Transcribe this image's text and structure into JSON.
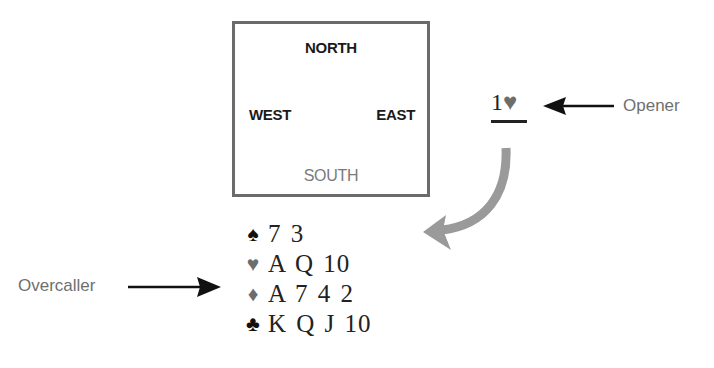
{
  "table": {
    "north": "NORTH",
    "west": "WEST",
    "east": "EAST",
    "south": "SOUTH"
  },
  "bid": {
    "level": "1",
    "suit_symbol": "♥",
    "suit_name": "hearts"
  },
  "labels": {
    "opener": "Opener",
    "overcaller": "Overcaller"
  },
  "hand": [
    {
      "suit": "spades",
      "symbol": "♠",
      "cards": "7 3",
      "color": "#111111"
    },
    {
      "suit": "hearts",
      "symbol": "♥",
      "cards": "A Q 10",
      "color": "#6d6d6d"
    },
    {
      "suit": "diamonds",
      "symbol": "♦",
      "cards": "A 7 4 2",
      "color": "#6d6d6d"
    },
    {
      "suit": "clubs",
      "symbol": "♣",
      "cards": "K Q J 10",
      "color": "#111111"
    }
  ],
  "colors": {
    "border": "#6b6b6b",
    "curved_arrow": "#9a9a9a",
    "label_text": "#6f6f6f",
    "black_suit": "#111111",
    "red_suit_gray": "#6d6d6d"
  }
}
